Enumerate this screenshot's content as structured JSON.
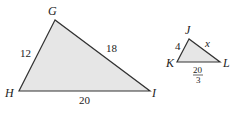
{
  "diagram": {
    "fill_color": "#e6e6e6",
    "stroke_color": "#333333",
    "triangles": [
      {
        "name": "GHI",
        "vertices": {
          "G": "G",
          "H": "H",
          "I": "I"
        },
        "sides": {
          "GH": "12",
          "GI": "18",
          "HI": "20"
        }
      },
      {
        "name": "JKL",
        "vertices": {
          "J": "J",
          "K": "K",
          "L": "L"
        },
        "sides": {
          "JK": "4",
          "JL": "x",
          "KL_num": "20",
          "KL_den": "3"
        }
      }
    ]
  }
}
